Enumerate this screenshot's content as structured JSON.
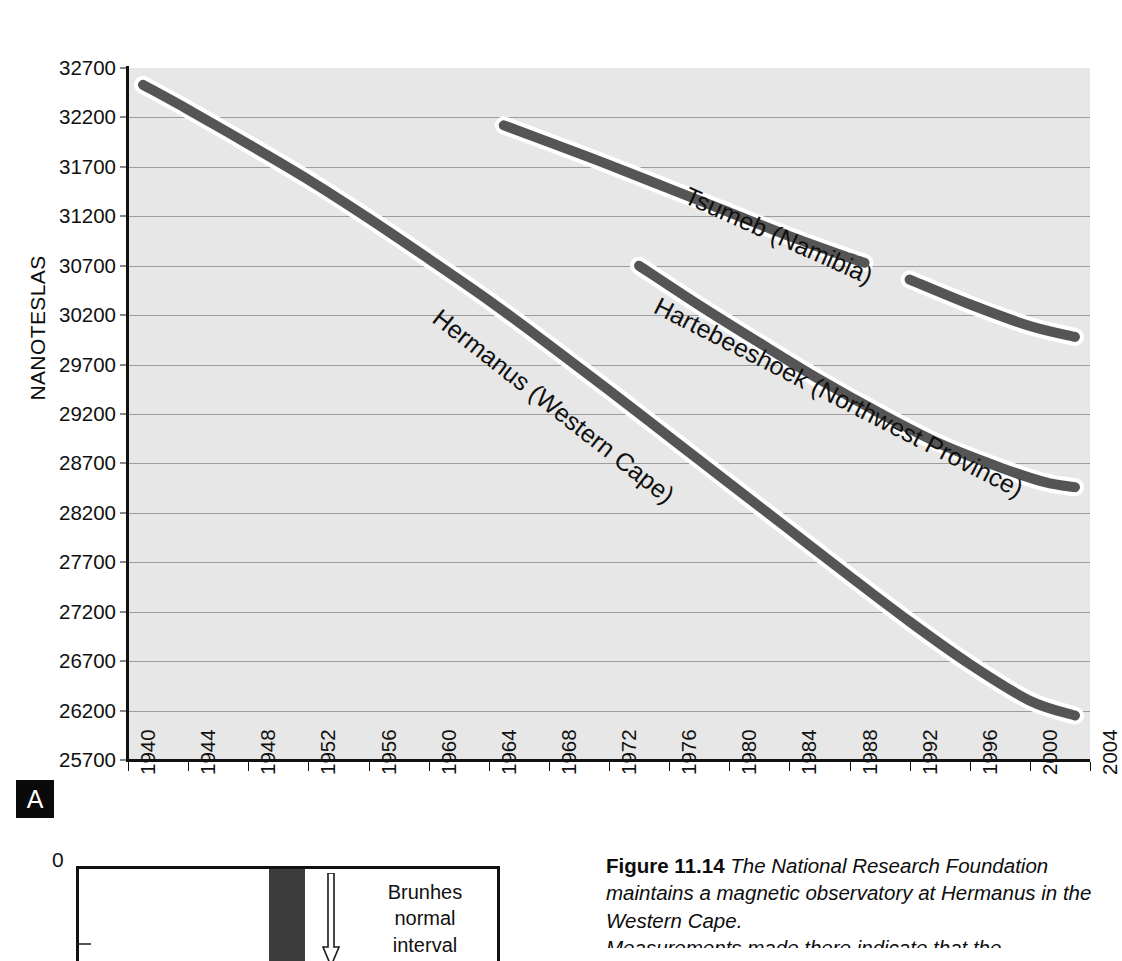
{
  "panel": {
    "label": "A"
  },
  "axes": {
    "y_title": "NANOTESLAS",
    "y_ticks": [
      "32700",
      "32200",
      "31700",
      "31200",
      "30700",
      "30200",
      "29700",
      "29200",
      "28700",
      "28200",
      "27700",
      "27200",
      "26700",
      "26200",
      "25700"
    ],
    "x_ticks": [
      "1940",
      "1944",
      "1948",
      "1952",
      "1956",
      "1960",
      "1964",
      "1968",
      "1972",
      "1976",
      "1980",
      "1984",
      "1988",
      "1992",
      "1996",
      "2000",
      "2004"
    ]
  },
  "series_labels": {
    "hermanus": "Hermanus (Western Cape)",
    "tsumeb": "Tsumeb (Namibia)",
    "hartebeeshoek": "Hartebeeshoek (Northwest Province)"
  },
  "panel_b": {
    "zero_label": "0",
    "interval_label_line1": "Brunhes",
    "interval_label_line2": "normal",
    "interval_label_line3": "interval"
  },
  "caption": {
    "lead": "Figure",
    "number": "11.14",
    "line1": "The National Research",
    "line2": "Foundation maintains a magnetic observatory",
    "line3": "at Hermanus in the Western Cape.",
    "line4": "Measurements made there indicate that the"
  },
  "colors": {
    "plot_background": "#e7e7e7",
    "gridline": "#8e8e8e",
    "curve": "#555555",
    "curve_halo": "#ffffff",
    "axis": "#111111",
    "badge_background": "#0a0a0a",
    "panel_b_band": "#3b3b3b"
  },
  "chart_data": {
    "type": "line",
    "title": "",
    "xlabel": "",
    "ylabel": "NANOTESLAS",
    "xlim": [
      1940,
      2004
    ],
    "ylim": [
      25700,
      32700
    ],
    "grid": true,
    "legend": "inline-curve-labels",
    "y_tick_step": 500,
    "x_tick_step": 4,
    "series": [
      {
        "name": "Hermanus (Western Cape)",
        "x": [
          1941,
          1944,
          1948,
          1952,
          1956,
          1960,
          1964,
          1968,
          1972,
          1976,
          1980,
          1984,
          1988,
          1992,
          1996,
          2000,
          2003
        ],
        "values": [
          32530,
          32280,
          31930,
          31570,
          31180,
          30770,
          30350,
          29900,
          29440,
          28970,
          28500,
          28030,
          27560,
          27100,
          26670,
          26300,
          26150
        ]
      },
      {
        "name": "Tsumeb (Namibia)",
        "segments": [
          {
            "x": [
              1965,
              1968,
              1972,
              1976,
              1980,
              1984,
              1988,
              1989
            ],
            "values": [
              32120,
              31950,
              31720,
              31480,
              31240,
              31000,
              30780,
              30730
            ]
          },
          {
            "x": [
              1992,
              1996,
              2000,
              2003
            ],
            "values": [
              30560,
              30310,
              30090,
              29980
            ]
          }
        ]
      },
      {
        "name": "Hartebeeshoek (Northwest Province)",
        "x": [
          1974,
          1978,
          1982,
          1986,
          1990,
          1994,
          1998,
          2001,
          2003
        ],
        "values": [
          30700,
          30300,
          29920,
          29550,
          29210,
          28900,
          28660,
          28510,
          28460
        ]
      }
    ]
  }
}
